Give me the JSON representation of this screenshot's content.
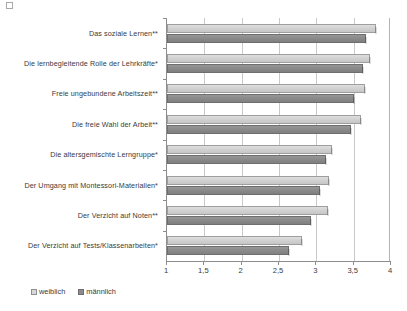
{
  "chart_data": {
    "type": "bar",
    "orientation": "horizontal",
    "title": "",
    "subtitle": "",
    "xlabel": "",
    "ylabel": "",
    "xlim": [
      1,
      4
    ],
    "xticks": [
      1,
      1.5,
      2,
      2.5,
      3,
      3.5,
      4
    ],
    "xticklabels": [
      "1",
      "1,5",
      "2",
      "2,5",
      "3",
      "3,5",
      "4"
    ],
    "grid": true,
    "grid_axis": "x",
    "legend_position": "bottom-left",
    "categories": [
      "Das soziale Lernen**",
      "Die lernbegleitende Rolle der Lehrkräfte*",
      "Freie ungebundene Arbeitszeit**",
      "Die freie Wahl der Arbeit**",
      "Die altersgemischte Lerngruppe*",
      "Der Umgang mit Montessori-Materialien*",
      "Der Verzicht auf Noten**",
      "Der Verzicht auf Tests/Klassenarbeiten*"
    ],
    "series": [
      {
        "name": "weiblich",
        "color": "#d2d2d2",
        "values": [
          3.8,
          3.72,
          3.65,
          3.6,
          3.21,
          3.17,
          3.16,
          2.81
        ]
      },
      {
        "name": "männlich",
        "color": "#8b8b8b",
        "values": [
          3.66,
          3.62,
          3.5,
          3.47,
          3.13,
          3.05,
          2.93,
          2.63
        ]
      }
    ]
  },
  "legend": {
    "items": [
      {
        "label": "weiblich"
      },
      {
        "label": "männlich"
      }
    ]
  }
}
